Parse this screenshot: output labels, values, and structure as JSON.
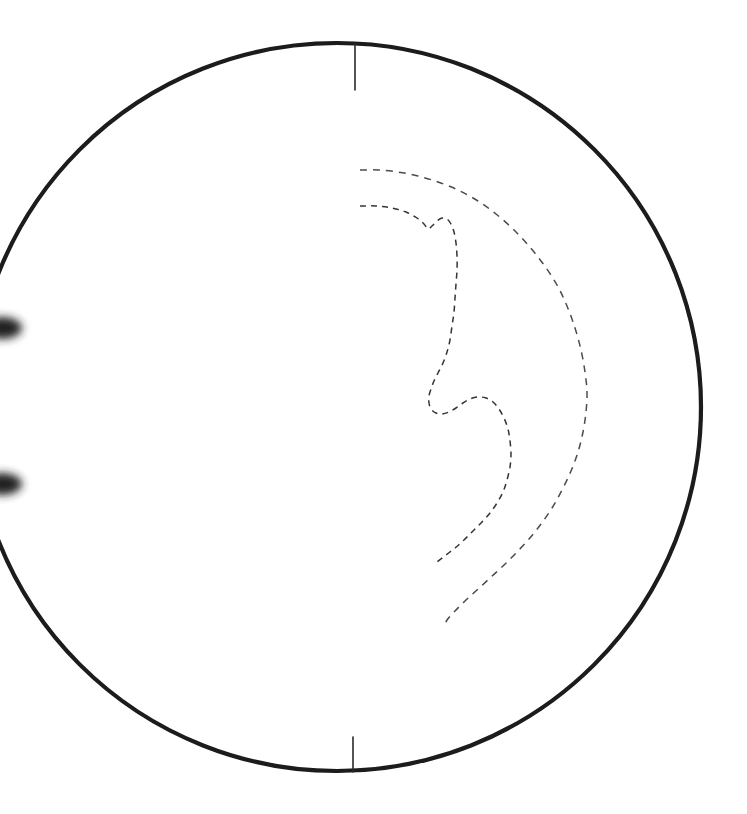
{
  "figure": {
    "title": "Disk limb contour diagram",
    "background_color": "#ffffff",
    "width": 747,
    "height": 814,
    "caption": ""
  },
  "colors": {
    "limb_stroke": "#1a1a1a",
    "tick_stroke": "#2a2a2a",
    "contour_outer_stroke": "#4a4a55",
    "contour_inner_stroke": "#33333d",
    "blob_fill": "#242424",
    "background": "#ffffff"
  },
  "chart_data": {
    "type": "line",
    "title": "Disk limb contour diagram",
    "subtitle": "",
    "xlabel": "",
    "ylabel": "",
    "xlim": [
      0,
      747
    ],
    "ylim": [
      814,
      0
    ],
    "grid": false,
    "legend_position": "none",
    "tick_labels": [],
    "annotations": [],
    "disk": {
      "name": "limb-circle",
      "center_x": 337,
      "center_y": 407,
      "radius": 364,
      "stroke_width": 4.2,
      "clipped_left_edge": true,
      "clip_span_y": [
        327,
        483
      ]
    },
    "orientation_ticks": [
      {
        "name": "top-tick",
        "x1": 355,
        "y1": 43,
        "x2": 355,
        "y2": 90,
        "stroke_width": 1.6
      },
      {
        "name": "bottom-tick",
        "x1": 353,
        "y1": 737,
        "x2": 353,
        "y2": 772,
        "stroke_width": 1.6
      }
    ],
    "edge_blobs": [
      {
        "name": "upper-left-edge-blob",
        "cx": 2,
        "cy": 328,
        "rx": 20,
        "ry": 11
      },
      {
        "name": "lower-left-edge-blob",
        "cx": 2,
        "cy": 484,
        "rx": 20,
        "ry": 11
      }
    ],
    "series": [
      {
        "name": "outer-contour",
        "style": "dashed",
        "dash_pattern": "7 6",
        "stroke_width": 1.5,
        "points": [
          [
            360,
            170
          ],
          [
            378,
            170
          ],
          [
            398,
            172
          ],
          [
            418,
            176
          ],
          [
            438,
            182
          ],
          [
            458,
            190
          ],
          [
            478,
            201
          ],
          [
            496,
            214
          ],
          [
            513,
            229
          ],
          [
            529,
            246
          ],
          [
            544,
            265
          ],
          [
            557,
            285
          ],
          [
            567,
            306
          ],
          [
            575,
            328
          ],
          [
            581,
            350
          ],
          [
            585,
            372
          ],
          [
            587,
            392
          ],
          [
            586,
            412
          ],
          [
            583,
            432
          ],
          [
            578,
            452
          ],
          [
            571,
            471
          ],
          [
            562,
            490
          ],
          [
            552,
            508
          ],
          [
            541,
            524
          ],
          [
            529,
            539
          ],
          [
            516,
            553
          ],
          [
            503,
            566
          ],
          [
            490,
            578
          ],
          [
            477,
            590
          ],
          [
            465,
            601
          ],
          [
            455,
            611
          ],
          [
            447,
            620
          ],
          [
            445,
            627
          ]
        ]
      },
      {
        "name": "inner-contour",
        "style": "dashed",
        "dash_pattern": "6 5",
        "stroke_width": 1.5,
        "points": [
          [
            360,
            206
          ],
          [
            376,
            206
          ],
          [
            392,
            208
          ],
          [
            406,
            212
          ],
          [
            417,
            218
          ],
          [
            424,
            224
          ],
          [
            428,
            229
          ],
          [
            432,
            226
          ],
          [
            437,
            221
          ],
          [
            442,
            218
          ],
          [
            447,
            219
          ],
          [
            451,
            224
          ],
          [
            454,
            232
          ],
          [
            456,
            243
          ],
          [
            457,
            256
          ],
          [
            457,
            270
          ],
          [
            456,
            284
          ],
          [
            455,
            298
          ],
          [
            454,
            312
          ],
          [
            452,
            326
          ],
          [
            450,
            340
          ],
          [
            447,
            352
          ],
          [
            443,
            363
          ],
          [
            438,
            373
          ],
          [
            434,
            381
          ],
          [
            431,
            389
          ],
          [
            429,
            396
          ],
          [
            429,
            403
          ],
          [
            431,
            409
          ],
          [
            436,
            413
          ],
          [
            442,
            414
          ],
          [
            449,
            412
          ],
          [
            456,
            408
          ],
          [
            463,
            403
          ],
          [
            470,
            399
          ],
          [
            478,
            397
          ],
          [
            486,
            398
          ],
          [
            493,
            402
          ],
          [
            499,
            409
          ],
          [
            504,
            418
          ],
          [
            508,
            429
          ],
          [
            510,
            441
          ],
          [
            511,
            454
          ],
          [
            510,
            467
          ],
          [
            507,
            480
          ],
          [
            503,
            492
          ],
          [
            497,
            503
          ],
          [
            490,
            513
          ],
          [
            482,
            522
          ],
          [
            473,
            531
          ],
          [
            464,
            540
          ],
          [
            455,
            548
          ],
          [
            446,
            555
          ],
          [
            437,
            562
          ]
        ]
      }
    ]
  }
}
